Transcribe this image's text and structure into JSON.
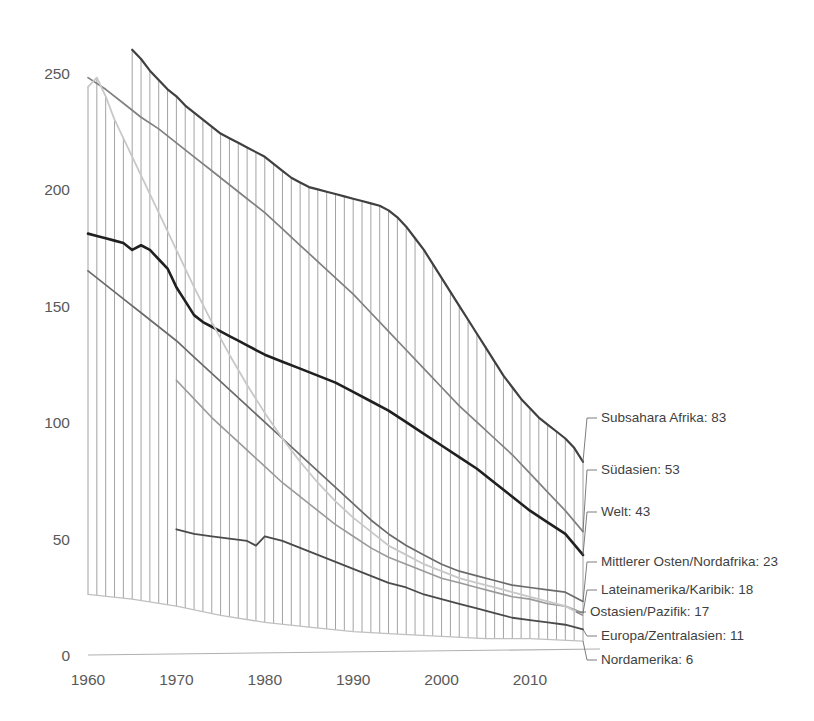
{
  "chart_data": {
    "type": "line",
    "title": "",
    "subtitle": "",
    "xlabel": "",
    "ylabel": "",
    "xlim": [
      1960,
      2016
    ],
    "ylim": [
      0,
      265
    ],
    "yticks": [
      0,
      50,
      100,
      150,
      200,
      250
    ],
    "xticks": [
      1960,
      1970,
      1980,
      1990,
      2000,
      2010
    ],
    "grid": "vertical-hatch",
    "legend_position": "right-end-labels",
    "series": [
      {
        "name": "Subsahara Afrika",
        "end_value": 83,
        "label": "Subsahara Afrika: 83",
        "color": "#404040",
        "width": 2.2,
        "x": [
          1965,
          1966,
          1967,
          1968,
          1969,
          1970,
          1971,
          1972,
          1973,
          1974,
          1975,
          1976,
          1977,
          1978,
          1979,
          1980,
          1981,
          1982,
          1983,
          1984,
          1985,
          1986,
          1987,
          1988,
          1989,
          1990,
          1991,
          1992,
          1993,
          1994,
          1995,
          1996,
          1997,
          1998,
          1999,
          2000,
          2001,
          2002,
          2003,
          2004,
          2005,
          2006,
          2007,
          2008,
          2009,
          2010,
          2011,
          2012,
          2013,
          2014,
          2015,
          2016
        ],
        "y": [
          260,
          256,
          251,
          247,
          243,
          240,
          236,
          233,
          230,
          227,
          224,
          222,
          220,
          218,
          216,
          214,
          211,
          208,
          205,
          203,
          201,
          200,
          199,
          198,
          197,
          196,
          195,
          194,
          193,
          191,
          188,
          184,
          179,
          174,
          168,
          162,
          156,
          150,
          144,
          138,
          132,
          126,
          120,
          115,
          110,
          106,
          102,
          99,
          96,
          93,
          89,
          83
        ]
      },
      {
        "name": "Südasien",
        "end_value": 53,
        "label": "Südasien: 53",
        "color": "#808080",
        "width": 1.7,
        "x": [
          1960,
          1962,
          1964,
          1966,
          1968,
          1970,
          1972,
          1974,
          1976,
          1978,
          1980,
          1982,
          1984,
          1986,
          1988,
          1990,
          1992,
          1994,
          1996,
          1998,
          2000,
          2002,
          2004,
          2006,
          2008,
          2010,
          2012,
          2014,
          2016
        ],
        "y": [
          248,
          243,
          237,
          231,
          226,
          220,
          214,
          208,
          202,
          196,
          190,
          183,
          176,
          169,
          162,
          155,
          147,
          139,
          131,
          123,
          115,
          107,
          100,
          93,
          86,
          78,
          70,
          62,
          53
        ]
      },
      {
        "name": "Welt",
        "end_value": 43,
        "label": "Welt: 43",
        "color": "#202020",
        "width": 2.6,
        "x": [
          1960,
          1961,
          1962,
          1963,
          1964,
          1965,
          1966,
          1967,
          1968,
          1969,
          1970,
          1971,
          1972,
          1973,
          1974,
          1975,
          1976,
          1977,
          1978,
          1979,
          1980,
          1982,
          1984,
          1986,
          1988,
          1990,
          1992,
          1994,
          1996,
          1998,
          2000,
          2002,
          2004,
          2006,
          2008,
          2010,
          2012,
          2014,
          2016
        ],
        "y": [
          181,
          180,
          179,
          178,
          177,
          174,
          176,
          174,
          170,
          166,
          158,
          152,
          146,
          143,
          141,
          139,
          137,
          135,
          133,
          131,
          129,
          126,
          123,
          120,
          117,
          113,
          109,
          105,
          100,
          95,
          90,
          85,
          80,
          74,
          68,
          62,
          57,
          52,
          43
        ]
      },
      {
        "name": "Mittlerer Osten/Nordafrika",
        "end_value": 23,
        "label": "Mittlerer Osten/Nordafrika: 23",
        "color": "#6b6b6b",
        "width": 1.7,
        "x": [
          1960,
          1962,
          1964,
          1966,
          1968,
          1970,
          1972,
          1974,
          1976,
          1978,
          1980,
          1982,
          1984,
          1986,
          1988,
          1990,
          1992,
          1994,
          1996,
          1998,
          2000,
          2002,
          2004,
          2006,
          2008,
          2010,
          2012,
          2014,
          2016
        ],
        "y": [
          165,
          159,
          153,
          147,
          141,
          135,
          128,
          121,
          114,
          107,
          100,
          93,
          86,
          79,
          72,
          65,
          58,
          52,
          47,
          43,
          39,
          36,
          34,
          32,
          30,
          29,
          28,
          27,
          23
        ]
      },
      {
        "name": "Lateinamerika/Karibik",
        "end_value": 18,
        "label": "Lateinamerika/Karibik: 18",
        "color": "#9a9a9a",
        "width": 1.6,
        "x": [
          1970,
          1972,
          1974,
          1976,
          1978,
          1980,
          1982,
          1984,
          1986,
          1988,
          1990,
          1992,
          1994,
          1996,
          1998,
          2000,
          2002,
          2004,
          2006,
          2008,
          2010,
          2012,
          2014,
          2016
        ],
        "y": [
          118,
          110,
          102,
          95,
          88,
          81,
          74,
          68,
          62,
          56,
          51,
          46,
          42,
          39,
          36,
          33,
          31,
          29,
          27,
          25,
          24,
          22,
          21,
          18
        ]
      },
      {
        "name": "Ostasien/Pazifik",
        "end_value": 17,
        "label": "Ostasien/Pazifik: 17",
        "color": "#c8c8c8",
        "width": 1.8,
        "x": [
          1960,
          1961,
          1962,
          1963,
          1964,
          1966,
          1968,
          1970,
          1972,
          1974,
          1976,
          1978,
          1980,
          1982,
          1984,
          1986,
          1988,
          1990,
          1992,
          1994,
          1996,
          1998,
          2000,
          2002,
          2004,
          2006,
          2008,
          2010,
          2012,
          2014,
          2016
        ],
        "y": [
          244,
          248,
          240,
          230,
          222,
          206,
          190,
          174,
          158,
          143,
          129,
          116,
          104,
          93,
          83,
          74,
          66,
          59,
          53,
          47,
          43,
          39,
          36,
          33,
          31,
          29,
          27,
          25,
          23,
          21,
          17
        ]
      },
      {
        "name": "Europa/Zentralasien",
        "end_value": 11,
        "label": "Europa/Zentralasien: 11",
        "color": "#4a4a4a",
        "width": 1.8,
        "x": [
          1970,
          1972,
          1974,
          1976,
          1978,
          1979,
          1980,
          1982,
          1984,
          1986,
          1988,
          1990,
          1992,
          1994,
          1996,
          1998,
          2000,
          2002,
          2004,
          2006,
          2008,
          2010,
          2012,
          2014,
          2016
        ],
        "y": [
          54,
          52,
          51,
          50,
          49,
          47,
          51,
          49,
          46,
          43,
          40,
          37,
          34,
          31,
          29,
          26,
          24,
          22,
          20,
          18,
          16,
          15,
          14,
          13,
          11
        ]
      },
      {
        "name": "Nordamerika",
        "end_value": 6,
        "label": "Nordamerika: 6",
        "color": "#c0c0c0",
        "width": 1.3,
        "x": [
          1960,
          1965,
          1970,
          1975,
          1980,
          1985,
          1990,
          1995,
          2000,
          2005,
          2010,
          2016
        ],
        "y": [
          26,
          24,
          21,
          17,
          14,
          12,
          10,
          9,
          8,
          7,
          7,
          6
        ]
      }
    ]
  },
  "axes": {
    "ytick_labels": [
      "250",
      "200",
      "150",
      "100",
      "50",
      "0"
    ],
    "xtick_labels": [
      "1960",
      "1970",
      "1980",
      "1990",
      "2000",
      "2010"
    ]
  },
  "legend": {
    "items": [
      {
        "label": "Subsahara Afrika: 83"
      },
      {
        "label": "Südasien: 53"
      },
      {
        "label": "Welt: 43"
      },
      {
        "label": "Mittlerer Osten/Nordafrika: 23"
      },
      {
        "label": "Lateinamerika/Karibik: 18"
      },
      {
        "label": "Ostasien/Pazifik: 17"
      },
      {
        "label": "Europa/Zentralasien: 11"
      },
      {
        "label": "Nordamerika: 6"
      }
    ]
  }
}
